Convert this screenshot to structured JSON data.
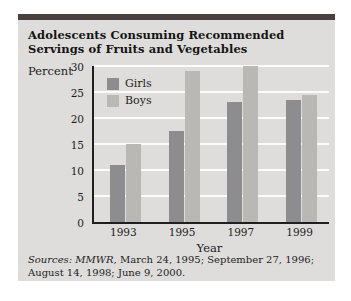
{
  "figure": {
    "y_unit_label": "Percent"
  },
  "sources": {
    "line1_prefix": "Sources:",
    "line1_journal": " MMWR",
    "line1_rest": ", March 24, 1995; September 27, 1996;",
    "line2": "August 14, 1998; June 9, 2000."
  },
  "colors": {
    "accent_bar": "#49403f",
    "panel_bg": "#dedddb",
    "gridline": "#fbfbf9",
    "axis": "#1f1f1f",
    "girls_bar": "#8d8d8f",
    "boys_bar": "#b9b8b4"
  },
  "chart_data": {
    "type": "bar",
    "title": "Adolescents Consuming Recommended Servings of Fruits and Vegetables",
    "categories": [
      "1993",
      "1995",
      "1997",
      "1999"
    ],
    "series": [
      {
        "name": "Girls",
        "color": "#8d8d8f",
        "values": [
          11,
          17.5,
          23,
          23.5
        ]
      },
      {
        "name": "Boys",
        "color": "#b9b8b4",
        "values": [
          15,
          29,
          30,
          24.5
        ]
      }
    ],
    "xlabel": "Year",
    "ylabel": "Percent",
    "ylim": [
      0,
      30
    ],
    "ytick_step": 5,
    "grid": true,
    "legend_position": "top-left"
  }
}
